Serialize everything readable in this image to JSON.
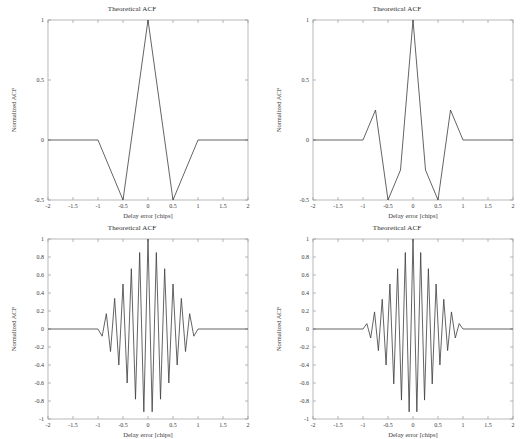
{
  "figure": {
    "background_color": "#ffffff",
    "axis_color": "#9a9a9a",
    "line_color": "#3c3c3c",
    "text_color": "#2b2b2b",
    "rows": 2,
    "cols": 2
  },
  "common": {
    "title": "Theoretical ACF",
    "xlabel": "Delay error [chips]",
    "ylabel": "Normalized ACF",
    "xticks": [
      "-2",
      "-1.5",
      "-1",
      "-0.5",
      "0",
      "0.5",
      "1",
      "1.5",
      "2"
    ],
    "xtick_values": [
      -2,
      -1.5,
      -1,
      -0.5,
      0,
      0.5,
      1,
      1.5,
      2
    ],
    "yticks_top": [
      "1",
      "0.5",
      "0",
      "-0.5"
    ],
    "ytick_values_top": [
      1,
      0.5,
      0,
      -0.5
    ],
    "yticks_bottom": [
      "1",
      "0.8",
      "0.6",
      "0.4",
      "0.2",
      "0",
      "-0.2",
      "-0.4",
      "-0.6",
      "-0.8",
      "-1"
    ],
    "ytick_values_bottom": [
      1,
      0.8,
      0.6,
      0.4,
      0.2,
      0,
      -0.2,
      -0.4,
      -0.6,
      -0.8,
      -1
    ]
  },
  "chart_data": [
    {
      "id": "acf-top-left",
      "type": "line",
      "title": "Theoretical ACF",
      "xlabel": "Delay error [chips]",
      "ylabel": "Normalized ACF",
      "xlim": [
        -2,
        2
      ],
      "ylim": [
        -0.5,
        1
      ],
      "grid": false,
      "legend": null,
      "series": [
        {
          "name": "BOC(1,1) ACF",
          "x": [
            -2,
            -1,
            -0.5,
            0,
            0.5,
            1,
            2
          ],
          "y": [
            0,
            0,
            -0.5,
            1,
            -0.5,
            0,
            0
          ]
        }
      ]
    },
    {
      "id": "acf-top-right",
      "type": "line",
      "title": "Theoretical ACF",
      "xlabel": "Delay error [chips]",
      "ylabel": "Normalized ACF",
      "xlim": [
        -2,
        2
      ],
      "ylim": [
        -0.5,
        1
      ],
      "grid": false,
      "legend": null,
      "series": [
        {
          "name": "BOC(2,1) ACF",
          "x": [
            -2,
            -1,
            -0.75,
            -0.5,
            -0.25,
            0,
            0.25,
            0.5,
            0.75,
            1,
            2
          ],
          "y": [
            0,
            0,
            0.25,
            -0.5,
            -0.25,
            1,
            -0.25,
            -0.5,
            0.25,
            0,
            0
          ]
        }
      ]
    },
    {
      "id": "acf-bottom-left",
      "type": "line",
      "title": "Theoretical ACF",
      "xlabel": "Delay error [chips]",
      "ylabel": "Normalized ACF",
      "xlim": [
        -2,
        2
      ],
      "ylim": [
        -1,
        1
      ],
      "grid": false,
      "legend": null,
      "series": [
        {
          "name": "High-order BOC ACF (n=8)",
          "peaks": [
            1,
            -0.92,
            0.85,
            -0.78,
            0.67,
            -0.6,
            0.5,
            -0.4,
            0.34,
            -0.25,
            0.17,
            -0.08
          ],
          "envelope": "triangular",
          "support": [
            -1,
            1
          ],
          "num_half_cycles": 32
        }
      ]
    },
    {
      "id": "acf-bottom-right",
      "type": "line",
      "title": "Theoretical ACF",
      "xlabel": "Delay error [chips]",
      "ylabel": "Normalized ACF",
      "xlim": [
        -2,
        2
      ],
      "ylim": [
        -1,
        1
      ],
      "grid": false,
      "legend": null,
      "series": [
        {
          "name": "High-order BOC ACF (n=10)",
          "peaks": [
            1,
            -0.92,
            0.85,
            -0.79,
            0.67,
            -0.61,
            0.5,
            -0.4,
            0.33,
            -0.24,
            0.19,
            -0.1,
            0.06
          ],
          "envelope": "triangular",
          "support": [
            -1,
            1
          ],
          "num_half_cycles": 40
        }
      ]
    }
  ]
}
